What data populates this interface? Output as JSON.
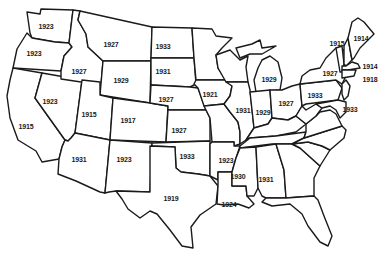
{
  "map": {
    "subject": "United States map with year labels by state",
    "colors": {
      "outline": "#1a1a1a",
      "fill": "#ffffff",
      "label": "#1a1a1a"
    },
    "labels": [
      {
        "state": "Washington",
        "year": "1923",
        "x": 46,
        "y": 26
      },
      {
        "state": "Oregon",
        "year": "1923",
        "x": 34,
        "y": 53
      },
      {
        "state": "California",
        "year": "1915",
        "x": 26,
        "y": 126
      },
      {
        "state": "Nevada",
        "year": "1923",
        "x": 50,
        "y": 101
      },
      {
        "state": "Idaho",
        "year": "1927",
        "x": 79,
        "y": 71
      },
      {
        "state": "Montana",
        "year": "1927",
        "x": 111,
        "y": 44
      },
      {
        "state": "Wyoming",
        "year": "1929",
        "x": 121,
        "y": 80
      },
      {
        "state": "Utah",
        "year": "1915",
        "x": 89,
        "y": 114
      },
      {
        "state": "Colorado",
        "year": "1917",
        "x": 128,
        "y": 120
      },
      {
        "state": "Arizona",
        "year": "1931",
        "x": 79,
        "y": 159
      },
      {
        "state": "New Mexico",
        "year": "1923",
        "x": 124,
        "y": 159
      },
      {
        "state": "North Dakota",
        "year": "1933",
        "x": 163,
        "y": 46
      },
      {
        "state": "South Dakota",
        "year": "1931",
        "x": 163,
        "y": 71
      },
      {
        "state": "Nebraska",
        "year": "1927",
        "x": 166,
        "y": 99
      },
      {
        "state": "Kansas",
        "year": "1927",
        "x": 179,
        "y": 130
      },
      {
        "state": "Oklahoma",
        "year": "1933",
        "x": 187,
        "y": 156
      },
      {
        "state": "Texas",
        "year": "1919",
        "x": 171,
        "y": 198
      },
      {
        "state": "Iowa",
        "year": "1921",
        "x": 210,
        "y": 94
      },
      {
        "state": "Arkansas",
        "year": "1923",
        "x": 226,
        "y": 160
      },
      {
        "state": "Louisiana",
        "year": "1924",
        "x": 229,
        "y": 204
      },
      {
        "state": "Mississippi",
        "year": "1930",
        "x": 238,
        "y": 176
      },
      {
        "state": "Alabama",
        "year": "1931",
        "x": 266,
        "y": 179
      },
      {
        "state": "Illinois",
        "year": "1931",
        "x": 243,
        "y": 110
      },
      {
        "state": "Michigan",
        "year": "1929",
        "x": 269,
        "y": 79
      },
      {
        "state": "Indiana",
        "year": "1929",
        "x": 263,
        "y": 112
      },
      {
        "state": "Ohio",
        "year": "1927",
        "x": 286,
        "y": 103
      },
      {
        "state": "Pennsylvania",
        "year": "1933",
        "x": 315,
        "y": 95
      },
      {
        "state": "New York",
        "year": "1927",
        "x": 330,
        "y": 73
      },
      {
        "state": "Vermont",
        "year": "1915",
        "x": 337,
        "y": 43
      },
      {
        "state": "Maine",
        "year": "1914",
        "x": 361,
        "y": 38
      },
      {
        "state": "Massachusetts",
        "year": "1914",
        "x": 370,
        "y": 66
      },
      {
        "state": "Connecticut",
        "year": "1918",
        "x": 370,
        "y": 79
      },
      {
        "state": "Maryland",
        "year": "1933",
        "x": 350,
        "y": 109
      }
    ]
  }
}
